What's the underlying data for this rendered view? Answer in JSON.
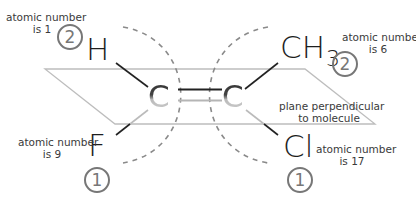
{
  "diagram": {
    "plane_label_line1": "plane perpendicular",
    "plane_label_line2": "to molecule",
    "atoms": {
      "top_left": "H",
      "top_right_main": "CH",
      "top_right_sub": "3",
      "bottom_left": "F",
      "bottom_right": "Cl",
      "carbon_left": "C",
      "carbon_right": "C"
    },
    "annotations": {
      "top_left": {
        "line1": "atomic number",
        "line2": "is 1",
        "priority": "2"
      },
      "top_right": {
        "line1": "atomic number",
        "line2": "is 6",
        "priority": "2"
      },
      "bottom_left": {
        "line1": "atomic number",
        "line2": "is 9",
        "priority": "1"
      },
      "bottom_right": {
        "line1": "atomic number",
        "line2": "is 17",
        "priority": "1"
      }
    },
    "colors": {
      "plane_edge": "#bbbbbb",
      "dashed_arc": "#888888",
      "bond_dark": "#222222",
      "bond_light": "#b5b5b5",
      "circle": "#777777",
      "text": "#3a3a3a"
    }
  }
}
